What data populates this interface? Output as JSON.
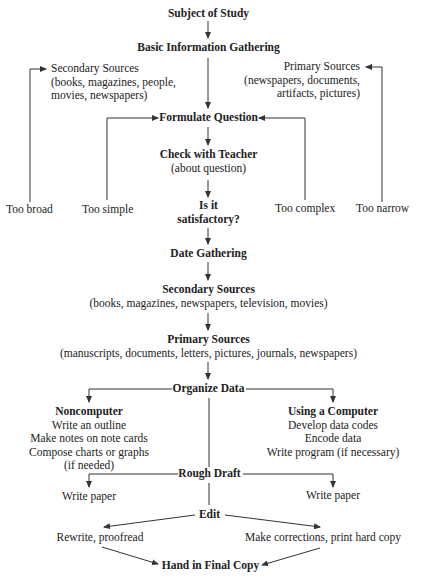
{
  "diagram": {
    "type": "flowchart",
    "nodes": {
      "subject": "Subject of Study",
      "basic_info": "Basic Information Gathering",
      "secondary_top": {
        "title": "Secondary Sources",
        "line1": "(books, magazines, people,",
        "line2": "movies, newspapers)"
      },
      "primary_top": {
        "title": "Primary Sources",
        "line1": "(newspapers, documents,",
        "line2": "artifacts, pictures)"
      },
      "formulate": "Formulate Question",
      "check_teacher": {
        "title": "Check with Teacher",
        "sub": "(about question)"
      },
      "satisfactory": {
        "line1": "Is it",
        "line2": "satisfactory?"
      },
      "too_broad": "Too broad",
      "too_simple": "Too simple",
      "too_complex": "Too complex",
      "too_narrow": "Too narrow",
      "date_gathering": "Date Gathering",
      "secondary_mid": {
        "title": "Secondary Sources",
        "sub": "(books, magazines, newspapers, television, movies)"
      },
      "primary_mid": {
        "title": "Primary Sources",
        "sub": "(manuscripts, documents, letters, pictures, journals, newspapers)"
      },
      "organize": "Organize Data",
      "noncomputer": {
        "title": "Noncomputer",
        "items": [
          "Write an outline",
          "Make notes on note cards",
          "Compose charts or graphs",
          "(if needed)"
        ]
      },
      "computer": {
        "title": "Using a Computer",
        "items": [
          "Develop data codes",
          "Encode data",
          "Write program (if necessary)"
        ]
      },
      "rough_draft": "Rough Draft",
      "write_paper_left": "Write paper",
      "write_paper_right": "Write paper",
      "edit": "Edit",
      "rewrite": "Rewrite, proofread",
      "corrections": "Make corrections, print hard copy",
      "final": "Hand in Final Copy"
    },
    "edges": [
      [
        "Subject of Study",
        "Basic Information Gathering"
      ],
      [
        "Basic Information Gathering",
        "Formulate Question"
      ],
      [
        "Formulate Question",
        "Check with Teacher"
      ],
      [
        "Check with Teacher",
        "Is it satisfactory?"
      ],
      [
        "Too broad",
        "Secondary Sources (top)"
      ],
      [
        "Too simple",
        "Formulate Question"
      ],
      [
        "Too complex",
        "Formulate Question"
      ],
      [
        "Too narrow",
        "Primary Sources (top)"
      ],
      [
        "Is it satisfactory?",
        "Date Gathering"
      ],
      [
        "Date Gathering",
        "Secondary Sources"
      ],
      [
        "Secondary Sources",
        "Primary Sources"
      ],
      [
        "Primary Sources",
        "Organize Data"
      ],
      [
        "Organize Data",
        "Noncomputer"
      ],
      [
        "Organize Data",
        "Using a Computer"
      ],
      [
        "Organize Data",
        "Rough Draft"
      ],
      [
        "Rough Draft",
        "Write paper (left)"
      ],
      [
        "Rough Draft",
        "Write paper (right)"
      ],
      [
        "Rough Draft",
        "Edit"
      ],
      [
        "Edit",
        "Rewrite, proofread"
      ],
      [
        "Edit",
        "Make corrections, print hard copy"
      ],
      [
        "Rewrite, proofread",
        "Hand in Final Copy"
      ],
      [
        "Make corrections, print hard copy",
        "Hand in Final Copy"
      ]
    ]
  }
}
